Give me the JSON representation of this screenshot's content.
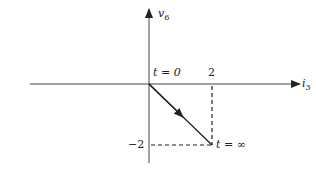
{
  "diagram": {
    "vertical_axis_label": "v",
    "vertical_axis_sub": "6",
    "horizontal_axis_label": "i",
    "horizontal_axis_sub": "3",
    "start_label": "t = 0",
    "end_label": "t = ∞",
    "x_tick": "2",
    "y_tick": "−2",
    "trajectory": {
      "from": [
        0,
        0
      ],
      "to": [
        2,
        -2
      ]
    },
    "colors": {
      "line": "#222222",
      "background": "#ffffff"
    }
  }
}
